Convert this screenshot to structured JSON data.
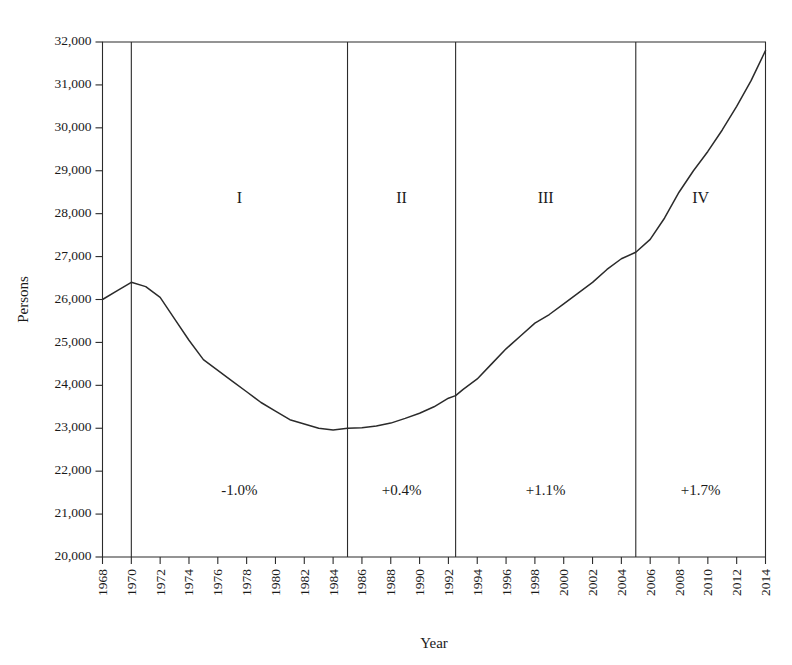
{
  "chart_data": {
    "type": "line",
    "title": "",
    "xlabel": "Year",
    "ylabel": "Persons",
    "xlim": [
      1968,
      2014
    ],
    "ylim": [
      20000,
      32000
    ],
    "grid": false,
    "legend": "none",
    "x_tick_labels": [
      "1968",
      "1970",
      "1972",
      "1974",
      "1976",
      "1978",
      "1980",
      "1982",
      "1984",
      "1986",
      "1988",
      "1990",
      "1992",
      "1994",
      "1996",
      "1998",
      "2000",
      "2002",
      "2004",
      "2006",
      "2008",
      "2010",
      "2012",
      "2014"
    ],
    "y_tick_labels": [
      "20,000",
      "21,000",
      "22,000",
      "23,000",
      "24,000",
      "25,000",
      "26,000",
      "27,000",
      "28,000",
      "29,000",
      "30,000",
      "31,000",
      "32,000"
    ],
    "y_tick_values": [
      20000,
      21000,
      22000,
      23000,
      24000,
      25000,
      26000,
      27000,
      28000,
      29000,
      30000,
      31000,
      32000
    ],
    "series": [
      {
        "name": "Persons",
        "x": [
          1968,
          1969,
          1970,
          1971,
          1972,
          1973,
          1974,
          1975,
          1976,
          1977,
          1978,
          1979,
          1980,
          1981,
          1982,
          1983,
          1984,
          1985,
          1986,
          1987,
          1988,
          1989,
          1990,
          1991,
          1992,
          1992.5,
          1993,
          1994,
          1995,
          1996,
          1997,
          1998,
          1999,
          2000,
          2001,
          2002,
          2003,
          2004,
          2005,
          2006,
          2007,
          2008,
          2009,
          2010,
          2011,
          2012,
          2013,
          2014
        ],
        "values": [
          26000,
          26200,
          26400,
          26300,
          26050,
          25550,
          25050,
          24600,
          24350,
          24100,
          23850,
          23600,
          23400,
          23200,
          23100,
          23000,
          22960,
          23000,
          23010,
          23050,
          23120,
          23230,
          23350,
          23500,
          23700,
          23760,
          23900,
          24150,
          24500,
          24850,
          25150,
          25450,
          25650,
          25900,
          26150,
          26400,
          26700,
          26950,
          27100,
          27400,
          27900,
          28500,
          29000,
          29450,
          29950,
          30500,
          31100,
          31800
        ]
      }
    ],
    "period_dividers": [
      1970,
      1985,
      1992.5,
      2005
    ],
    "periods": [
      {
        "roman": "I",
        "rate": "-1.0%",
        "start": 1970,
        "end": 1985
      },
      {
        "roman": "II",
        "rate": "+0.4%",
        "start": 1985,
        "end": 1992.5
      },
      {
        "roman": "III",
        "rate": "+1.1%",
        "start": 1992.5,
        "end": 2005
      },
      {
        "roman": "IV",
        "rate": "+1.7%",
        "start": 2005,
        "end": 2014
      }
    ],
    "period_roman_y": 28250,
    "period_rate_y": 21450,
    "colors": {
      "line": "#2b2b2b",
      "axis": "#2b2b2b",
      "text": "#1a1a1a",
      "background": "#ffffff"
    }
  }
}
